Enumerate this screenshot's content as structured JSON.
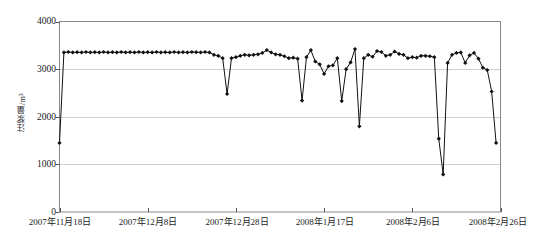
{
  "chart_data": {
    "type": "line",
    "title": "",
    "subtitle": "",
    "xlabel": "",
    "ylabel": "注浆量/m³",
    "ylim": [
      0,
      4000
    ],
    "ytick_labels": [
      "0",
      "1000",
      "2000",
      "3000",
      "4000"
    ],
    "ytick_values": [
      0,
      1000,
      2000,
      3000,
      4000
    ],
    "xtick_labels": [
      "2007年11月18日",
      "2007年12月8日",
      "2007年12月28日",
      "2008年1月17日",
      "2008年2月6日",
      "2008年2月26日"
    ],
    "xtick_values": [
      0,
      20,
      40,
      60,
      80,
      100
    ],
    "xlim": [
      0,
      100
    ],
    "grid": "horizontal",
    "legend": "none",
    "marker": "diamond",
    "series_color": "#111111",
    "series": [
      {
        "name": "注浆量",
        "x": [
          0,
          1,
          2,
          3,
          4,
          5,
          6,
          7,
          8,
          9,
          10,
          11,
          12,
          13,
          14,
          15,
          16,
          17,
          18,
          19,
          20,
          21,
          22,
          23,
          24,
          25,
          26,
          27,
          28,
          29,
          30,
          31,
          32,
          33,
          34,
          35,
          36,
          37,
          38,
          39,
          40,
          41,
          42,
          43,
          44,
          45,
          46,
          47,
          48,
          49,
          50,
          51,
          52,
          53,
          54,
          55,
          56,
          57,
          58,
          59,
          60,
          61,
          62,
          63,
          64,
          65,
          66,
          67,
          68,
          69,
          70,
          71,
          72,
          73,
          74,
          75,
          76,
          77,
          78,
          79,
          80,
          81,
          82,
          83,
          84,
          85,
          86,
          87,
          88,
          89,
          90,
          91,
          92,
          93,
          94,
          95,
          96,
          97,
          98,
          99
        ],
        "values": [
          1450,
          3350,
          3360,
          3350,
          3355,
          3350,
          3360,
          3350,
          3355,
          3350,
          3360,
          3350,
          3355,
          3350,
          3360,
          3350,
          3355,
          3350,
          3360,
          3350,
          3355,
          3350,
          3360,
          3350,
          3355,
          3350,
          3360,
          3350,
          3355,
          3350,
          3360,
          3355,
          3350,
          3360,
          3350,
          3300,
          3280,
          3230,
          2480,
          3230,
          3250,
          3280,
          3300,
          3290,
          3300,
          3310,
          3340,
          3400,
          3350,
          3310,
          3300,
          3270,
          3230,
          3240,
          3220,
          2340,
          3250,
          3400,
          3160,
          3100,
          2900,
          3060,
          3080,
          3230,
          2330,
          3000,
          3140,
          3420,
          1800,
          3230,
          3300,
          3260,
          3380,
          3360,
          3280,
          3300,
          3370,
          3320,
          3300,
          3230,
          3250,
          3240,
          3280,
          3280,
          3270,
          3250,
          1540,
          790,
          3130,
          3300,
          3340,
          3350,
          3130,
          3290,
          3340,
          3220,
          3030,
          2980,
          2530,
          1450
        ]
      }
    ]
  }
}
